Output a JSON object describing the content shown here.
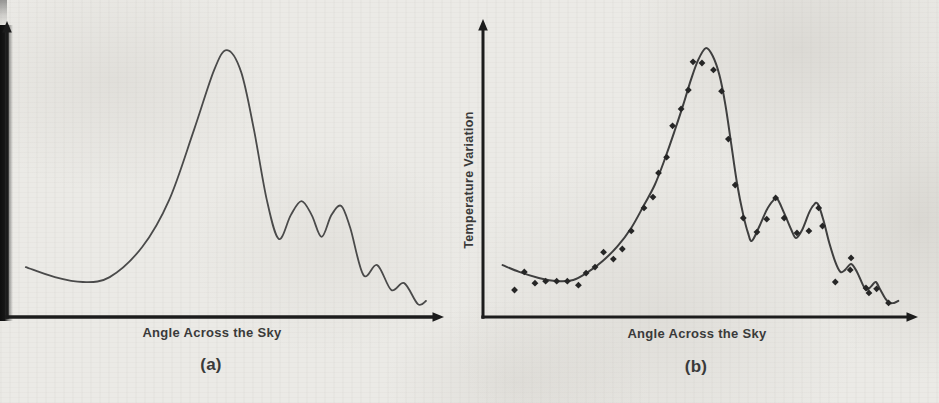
{
  "page": {
    "background": "#ebeae6",
    "ink": "#3a3a3a",
    "axis_color": "#1c1c1c"
  },
  "chart_data": [
    {
      "id": "a",
      "type": "line",
      "title": "",
      "xlabel": "Angle Across the Sky",
      "ylabel": "",
      "caption": "(a)",
      "grid": false,
      "legend": false,
      "tick_labels": "none (schematic sketch, axes unlabeled numerically)",
      "axes_arrows": true,
      "curve_color": "#4a4a4a",
      "coords_note": "points are [percent along x-axis, percent of plot height above baseline]",
      "curve": [
        [
          4.4,
          17.4
        ],
        [
          11.2,
          13.9
        ],
        [
          17.7,
          12.2
        ],
        [
          24.0,
          13.9
        ],
        [
          31.6,
          24.4
        ],
        [
          37.9,
          40.8
        ],
        [
          43.7,
          65.2
        ],
        [
          48.4,
          86.1
        ],
        [
          51.4,
          93.0
        ],
        [
          54.7,
          85.4
        ],
        [
          57.7,
          65.2
        ],
        [
          60.7,
          40.8
        ],
        [
          63.5,
          27.2
        ],
        [
          66.3,
          35.5
        ],
        [
          68.8,
          40.4
        ],
        [
          71.2,
          35.5
        ],
        [
          73.5,
          27.9
        ],
        [
          75.8,
          35.5
        ],
        [
          78.1,
          38.7
        ],
        [
          80.2,
          31.0
        ],
        [
          83.3,
          14.6
        ],
        [
          86.5,
          18.1
        ],
        [
          89.8,
          9.4
        ],
        [
          92.8,
          11.8
        ],
        [
          96.0,
          4.5
        ],
        [
          97.9,
          5.6
        ]
      ]
    },
    {
      "id": "b",
      "type": "line+scatter",
      "title": "",
      "xlabel": "Angle Across the Sky",
      "ylabel": "Temperature Variation",
      "caption": "(b)",
      "grid": false,
      "legend": false,
      "tick_labels": "none (schematic sketch, axes unlabeled numerically)",
      "axes_arrows": true,
      "curve_color": "#3f3f3f",
      "marker": "diamond",
      "marker_color": "#262626",
      "coords_note": "points are [percent along x-axis, percent of plot height above baseline]",
      "curve": [
        [
          4.6,
          18.1
        ],
        [
          8.5,
          15.7
        ],
        [
          13.1,
          13.6
        ],
        [
          17.3,
          12.5
        ],
        [
          21.2,
          12.9
        ],
        [
          24.7,
          15.7
        ],
        [
          28.1,
          19.5
        ],
        [
          31.6,
          24.7
        ],
        [
          34.8,
          31.0
        ],
        [
          37.8,
          39.0
        ],
        [
          40.3,
          46.0
        ],
        [
          42.6,
          54.7
        ],
        [
          44.9,
          64.5
        ],
        [
          47.0,
          73.9
        ],
        [
          48.8,
          82.6
        ],
        [
          50.5,
          89.5
        ],
        [
          52.3,
          93.7
        ],
        [
          53.9,
          91.0
        ],
        [
          55.5,
          84.3
        ],
        [
          56.9,
          73.9
        ],
        [
          58.3,
          59.9
        ],
        [
          59.7,
          46.0
        ],
        [
          61.1,
          35.5
        ],
        [
          62.2,
          29.3
        ],
        [
          63.1,
          26.5
        ],
        [
          64.7,
          31.0
        ],
        [
          66.6,
          37.3
        ],
        [
          68.0,
          40.4
        ],
        [
          69.1,
          41.1
        ],
        [
          70.7,
          36.2
        ],
        [
          72.4,
          30.3
        ],
        [
          73.5,
          27.5
        ],
        [
          74.9,
          30.3
        ],
        [
          76.5,
          36.2
        ],
        [
          77.6,
          39.0
        ],
        [
          78.6,
          39.4
        ],
        [
          79.9,
          33.8
        ],
        [
          81.3,
          25.8
        ],
        [
          82.7,
          19.2
        ],
        [
          83.9,
          15.7
        ],
        [
          85.0,
          16.4
        ],
        [
          86.4,
          18.5
        ],
        [
          87.8,
          15.7
        ],
        [
          89.2,
          11.1
        ],
        [
          90.1,
          9.4
        ],
        [
          91.2,
          10.8
        ],
        [
          92.2,
          12.2
        ],
        [
          93.3,
          9.4
        ],
        [
          94.5,
          6.3
        ],
        [
          95.4,
          4.9
        ],
        [
          96.5,
          4.9
        ],
        [
          97.5,
          5.6
        ]
      ],
      "points": [
        [
          7.4,
          9.4
        ],
        [
          9.7,
          15.7
        ],
        [
          12.2,
          11.8
        ],
        [
          14.7,
          12.5
        ],
        [
          17.3,
          12.5
        ],
        [
          19.8,
          12.5
        ],
        [
          22.4,
          11.1
        ],
        [
          24.2,
          15.3
        ],
        [
          26.3,
          17.4
        ],
        [
          28.3,
          22.6
        ],
        [
          30.6,
          20.2
        ],
        [
          32.7,
          23.7
        ],
        [
          34.8,
          30.0
        ],
        [
          37.8,
          38.0
        ],
        [
          39.9,
          41.8
        ],
        [
          41.2,
          50.2
        ],
        [
          43.1,
          55.7
        ],
        [
          44.5,
          66.6
        ],
        [
          46.5,
          72.5
        ],
        [
          48.2,
          79.1
        ],
        [
          49.3,
          88.9
        ],
        [
          51.4,
          88.5
        ],
        [
          54.1,
          86.1
        ],
        [
          56.0,
          78.7
        ],
        [
          57.6,
          62.0
        ],
        [
          59.2,
          46.0
        ],
        [
          61.1,
          34.5
        ],
        [
          64.3,
          29.6
        ],
        [
          66.6,
          34.1
        ],
        [
          68.7,
          41.5
        ],
        [
          70.7,
          34.5
        ],
        [
          73.7,
          29.3
        ],
        [
          76.5,
          30.0
        ],
        [
          78.8,
          38.0
        ],
        [
          79.7,
          31.7
        ],
        [
          82.7,
          12.2
        ],
        [
          86.2,
          16.4
        ],
        [
          86.4,
          20.6
        ],
        [
          89.9,
          10.1
        ],
        [
          90.6,
          8.4
        ],
        [
          92.4,
          9.8
        ],
        [
          95.2,
          4.9
        ]
      ]
    }
  ]
}
